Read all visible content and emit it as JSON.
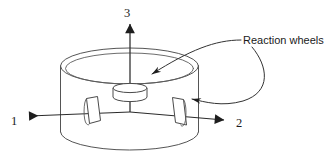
{
  "figure": {
    "background_color": "#ffffff",
    "line_color": "#555555",
    "axis_color": "#2b2b2b",
    "text_color": "#1a1a1a",
    "width": 334,
    "height": 163
  },
  "body": {
    "name": "spacecraft-cylinder",
    "shape": "cylinder"
  },
  "axes": [
    {
      "label": "1",
      "direction": "left",
      "label_x": 14,
      "label_y": 125,
      "from_x": 130,
      "from_y": 112,
      "to_x": 27,
      "to_y": 116
    },
    {
      "label": "2",
      "direction": "right",
      "label_x": 238,
      "label_y": 127,
      "from_x": 130,
      "from_y": 112,
      "to_x": 226,
      "to_y": 120
    },
    {
      "label": "3",
      "direction": "up",
      "label_x": 124,
      "label_y": 17,
      "from_x": 130,
      "from_y": 112,
      "to_x": 130,
      "to_y": 22
    }
  ],
  "callouts": [
    {
      "label": "Reaction wheels",
      "text_x": 243,
      "text_y": 44
    }
  ],
  "wheels": [
    {
      "id": "wheel-axis-3",
      "orientation": "horizontal-disc",
      "cx": 130,
      "cy": 92
    },
    {
      "id": "wheel-axis-1",
      "orientation": "vertical-disc-left",
      "cx": 93,
      "cy": 110
    },
    {
      "id": "wheel-axis-2",
      "orientation": "vertical-disc-right",
      "cx": 180,
      "cy": 112
    }
  ]
}
